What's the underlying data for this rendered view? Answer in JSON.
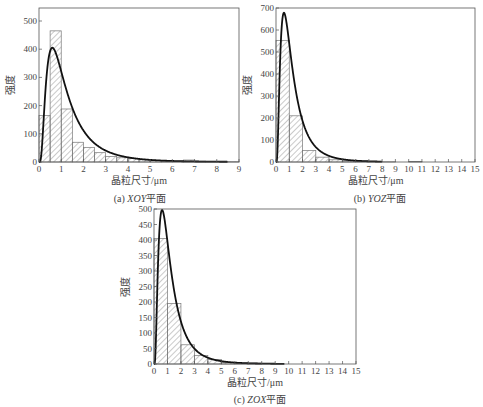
{
  "chart_data": [
    {
      "type": "bar",
      "id": "a",
      "title": "",
      "caption_prefix": "(a) ",
      "caption_italic": "XOY",
      "caption_suffix": "平面",
      "xlabel": "晶粒尺寸/μm",
      "ylabel": "强度",
      "xlim": [
        0,
        9
      ],
      "ylim": [
        0,
        550
      ],
      "xticks": [
        0,
        1,
        2,
        3,
        4,
        5,
        6,
        7,
        8,
        9
      ],
      "yticks": [
        0,
        100,
        200,
        300,
        400,
        500
      ],
      "bin_width": 0.5,
      "bins_start": [
        0,
        0.5,
        1,
        1.5,
        2,
        2.5,
        3,
        3.5,
        4,
        4.5,
        5,
        5.5,
        6,
        6.5,
        7,
        7.5,
        8,
        8.5
      ],
      "values": [
        165,
        465,
        188,
        70,
        52,
        33,
        20,
        15,
        12,
        8,
        5,
        3,
        3,
        7,
        3,
        2,
        1,
        1
      ],
      "fit_curve": {
        "type": "lognormal",
        "peak_x": 0.6,
        "peak_y": 405
      },
      "grid": false
    },
    {
      "type": "bar",
      "id": "b",
      "title": "",
      "caption_prefix": "(b) ",
      "caption_italic": "YOZ",
      "caption_suffix": "平面",
      "xlabel": "晶粒尺寸/μm",
      "ylabel": "强度",
      "xlim": [
        0,
        15
      ],
      "ylim": [
        0,
        700
      ],
      "xticks": [
        0,
        1,
        2,
        3,
        4,
        5,
        6,
        7,
        8,
        9,
        10,
        11,
        12,
        13,
        14,
        15
      ],
      "yticks": [
        0,
        100,
        200,
        300,
        400,
        500,
        600,
        700
      ],
      "bin_width": 1,
      "bins_start": [
        0,
        1,
        2,
        3,
        4,
        5,
        6,
        7,
        8,
        9,
        10
      ],
      "values": [
        553,
        210,
        52,
        22,
        10,
        5,
        4,
        2,
        1,
        0,
        3
      ],
      "fit_curve": {
        "type": "lognormal",
        "peak_x": 0.6,
        "peak_y": 678
      },
      "grid": false
    },
    {
      "type": "bar",
      "id": "c",
      "title": "",
      "caption_prefix": "(c) ",
      "caption_italic": "ZOX",
      "caption_suffix": "平面",
      "xlabel": "晶粒尺寸/μm",
      "ylabel": "强度",
      "xlim": [
        0,
        15
      ],
      "ylim": [
        0,
        500
      ],
      "xticks": [
        0,
        1,
        2,
        3,
        4,
        5,
        6,
        7,
        8,
        9,
        10,
        11,
        12,
        13,
        14,
        15
      ],
      "yticks": [
        0,
        50,
        100,
        150,
        200,
        250,
        300,
        350,
        400,
        450,
        500
      ],
      "bin_width": 1,
      "bins_start": [
        0,
        1,
        2,
        3,
        4,
        5,
        6,
        7
      ],
      "values": [
        405,
        195,
        62,
        27,
        15,
        5,
        3,
        3
      ],
      "fit_curve": {
        "type": "lognormal",
        "peak_x": 0.6,
        "peak_y": 497
      },
      "grid": false
    }
  ],
  "layout": [
    {
      "left": 39,
      "top": 21,
      "width": 200,
      "height": 141,
      "top_value": 500,
      "axis_top": 8
    },
    {
      "left": 276,
      "top": 8,
      "width": 199,
      "height": 154,
      "top_value": 700,
      "axis_top": 8
    },
    {
      "left": 154,
      "top": 209,
      "width": 202,
      "height": 155,
      "top_value": 500,
      "axis_top": 209
    }
  ]
}
